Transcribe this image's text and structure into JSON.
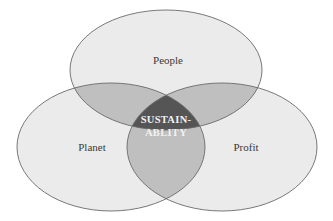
{
  "diagram": {
    "type": "venn",
    "sets": [
      {
        "id": "people",
        "label": "People"
      },
      {
        "id": "planet",
        "label": "Planet"
      },
      {
        "id": "profit",
        "label": "Profit"
      }
    ],
    "center": {
      "line1": "SUSTAIN-",
      "line2": "ABLITY"
    },
    "colors": {
      "single": "#ebebeb",
      "double": "#bfbfbf",
      "triple": "#555555",
      "stroke": "#6a6a6a"
    }
  }
}
